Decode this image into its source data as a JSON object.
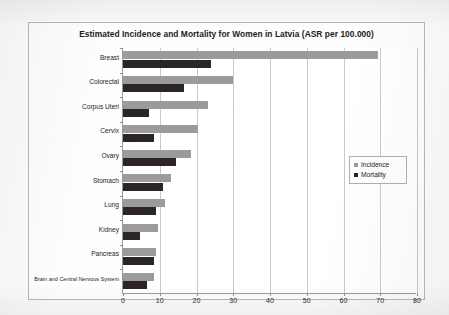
{
  "chart_data": {
    "type": "bar",
    "orientation": "horizontal",
    "title": "Estimated Incidence and Mortality for Women in Latvia (ASR per 100.000)",
    "xlabel": "",
    "ylabel": "",
    "xlim": [
      0,
      80
    ],
    "xticks": [
      0,
      10,
      20,
      30,
      40,
      50,
      60,
      70,
      80
    ],
    "grid": true,
    "legend_position": "center-right",
    "categories": [
      "Breast",
      "Colorectal",
      "Corpus Uteri",
      "Cervix",
      "Ovary",
      "Stomach",
      "Lung",
      "Kidney",
      "Pancreas",
      "Brain and Central Nervous System"
    ],
    "series": [
      {
        "name": "Incidence",
        "color": "#9b9b9b",
        "values": [
          69.5,
          30.0,
          23.0,
          20.5,
          18.5,
          13.0,
          11.5,
          9.5,
          9.0,
          8.5
        ]
      },
      {
        "name": "Mortality",
        "color": "#2b2523",
        "values": [
          24.0,
          16.5,
          7.0,
          8.5,
          14.5,
          11.0,
          9.0,
          4.5,
          8.5,
          6.5
        ]
      }
    ]
  }
}
